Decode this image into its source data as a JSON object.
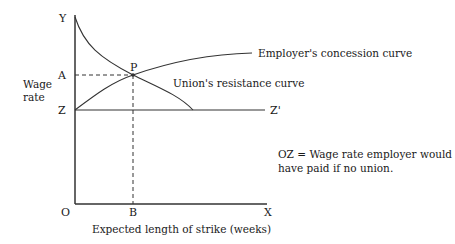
{
  "diagram": {
    "type": "economics-bargaining-diagram",
    "axes": {
      "y_axis_label": "Y",
      "x_axis_label": "X",
      "origin_label": "O",
      "y_title_line1": "Wage",
      "y_title_line2": "rate",
      "x_title": "Expected length of strike (weeks)"
    },
    "points": {
      "A": "A",
      "Z": "Z",
      "Z_prime": "Z'",
      "B": "B",
      "P": "P"
    },
    "curves": {
      "employer": "Employer's concession curve",
      "union": "Union's resistance curve"
    },
    "note": {
      "line1": "OZ = Wage rate employer would",
      "line2": "have paid if no union."
    },
    "colors": {
      "line": "#333333",
      "text": "#1a1a1a",
      "background": "#ffffff"
    }
  }
}
